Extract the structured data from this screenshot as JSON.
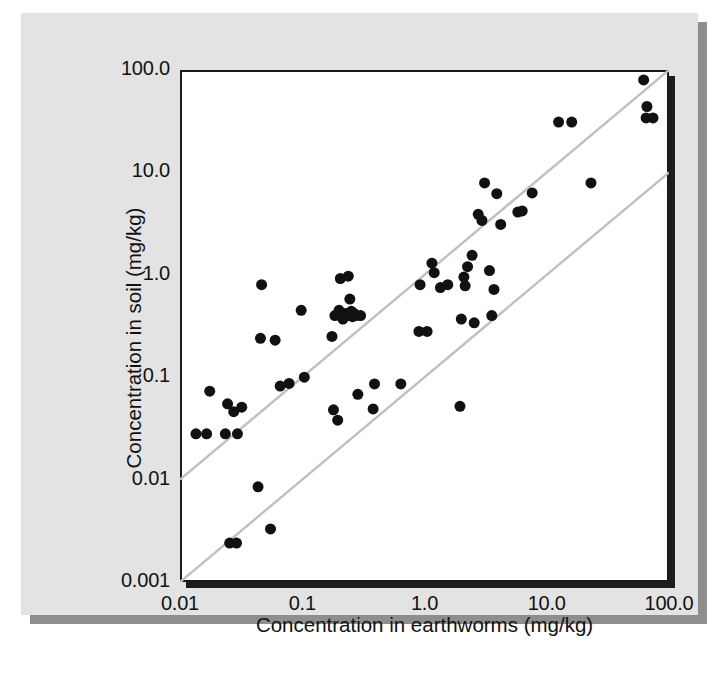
{
  "figure": {
    "background_color": "#e3e3e3",
    "page_color": "#ffffff",
    "shadow_color": "#8e8e8e",
    "frame_color": "#1a1a1a",
    "plot_background": "#ffffff"
  },
  "chart_data": {
    "type": "scatter",
    "title": "",
    "subtitle": "",
    "xlabel": "Concentration in earthworms (mg/kg)",
    "ylabel": "Concentration in soil (mg/kg)",
    "xscale": "log",
    "yscale": "log",
    "xlim": [
      0.01,
      100.0
    ],
    "ylim": [
      0.001,
      100.0
    ],
    "grid": false,
    "legend": null,
    "legend_position": "none",
    "xticks": [
      0.01,
      0.1,
      1.0,
      10.0,
      100.0
    ],
    "xticklabels": [
      "0.01",
      "0.1",
      "1.0",
      "10.0",
      "100.0"
    ],
    "yticks": [
      0.001,
      0.01,
      0.1,
      1.0,
      10.0,
      100.0
    ],
    "yticklabels": [
      "0.001",
      "0.01",
      "0.1",
      "1.0",
      "10.0",
      "100.0"
    ],
    "marker": "filled-circle",
    "marker_color": "#111111",
    "marker_size_px": 11,
    "reference_lines": [
      {
        "name": "ratio-1-to-1",
        "label": "soil = earthworm (1:1)",
        "color": "#c0c0c0",
        "slope": 1,
        "ratio": 1.0,
        "points": [
          [
            0.01,
            0.01
          ],
          [
            100.0,
            100.0
          ]
        ]
      },
      {
        "name": "ratio-1-to-10",
        "label": "soil = 0.1 x earthworm",
        "color": "#c0c0c0",
        "slope": 1,
        "ratio": 0.1,
        "points": [
          [
            0.01,
            0.001
          ],
          [
            100.0,
            10.0
          ]
        ]
      }
    ],
    "points": [
      [
        0.0135,
        0.028
      ],
      [
        0.0165,
        0.028
      ],
      [
        0.0175,
        0.073
      ],
      [
        0.0235,
        0.028
      ],
      [
        0.0245,
        0.055
      ],
      [
        0.0255,
        0.0024
      ],
      [
        0.0275,
        0.046
      ],
      [
        0.029,
        0.0024
      ],
      [
        0.0295,
        0.028
      ],
      [
        0.032,
        0.051
      ],
      [
        0.0435,
        0.0085
      ],
      [
        0.0455,
        0.24
      ],
      [
        0.0465,
        0.8
      ],
      [
        0.055,
        0.0033
      ],
      [
        0.06,
        0.23
      ],
      [
        0.066,
        0.082
      ],
      [
        0.078,
        0.087
      ],
      [
        0.098,
        0.45
      ],
      [
        0.104,
        0.1
      ],
      [
        0.175,
        0.25
      ],
      [
        0.18,
        0.048
      ],
      [
        0.185,
        0.4
      ],
      [
        0.195,
        0.038
      ],
      [
        0.2,
        0.45
      ],
      [
        0.205,
        0.92
      ],
      [
        0.215,
        0.37
      ],
      [
        0.225,
        0.42
      ],
      [
        0.232,
        0.4
      ],
      [
        0.238,
        0.97
      ],
      [
        0.245,
        0.58
      ],
      [
        0.252,
        0.44
      ],
      [
        0.258,
        0.39
      ],
      [
        0.265,
        0.42
      ],
      [
        0.275,
        0.4
      ],
      [
        0.285,
        0.068
      ],
      [
        0.3,
        0.4
      ],
      [
        0.38,
        0.049
      ],
      [
        0.39,
        0.086
      ],
      [
        0.64,
        0.086
      ],
      [
        0.9,
        0.28
      ],
      [
        0.92,
        0.8
      ],
      [
        1.05,
        0.28
      ],
      [
        1.15,
        1.3
      ],
      [
        1.2,
        1.05
      ],
      [
        1.35,
        0.75
      ],
      [
        1.55,
        0.8
      ],
      [
        1.95,
        0.052
      ],
      [
        2.0,
        0.37
      ],
      [
        2.1,
        0.95
      ],
      [
        2.15,
        0.78
      ],
      [
        2.25,
        1.2
      ],
      [
        2.45,
        1.55
      ],
      [
        2.55,
        0.34
      ],
      [
        2.75,
        3.9
      ],
      [
        2.95,
        3.4
      ],
      [
        3.1,
        7.9
      ],
      [
        3.4,
        1.1
      ],
      [
        3.55,
        0.4
      ],
      [
        3.7,
        0.72
      ],
      [
        3.9,
        6.2
      ],
      [
        4.2,
        3.1
      ],
      [
        5.8,
        4.1
      ],
      [
        6.3,
        4.2
      ],
      [
        7.6,
        6.3
      ],
      [
        12.5,
        31.0
      ],
      [
        16.0,
        31.0
      ],
      [
        23.0,
        7.9
      ],
      [
        62.0,
        80.0
      ],
      [
        66.0,
        44.0
      ],
      [
        65.0,
        34.0
      ],
      [
        74.0,
        34.0
      ]
    ]
  }
}
